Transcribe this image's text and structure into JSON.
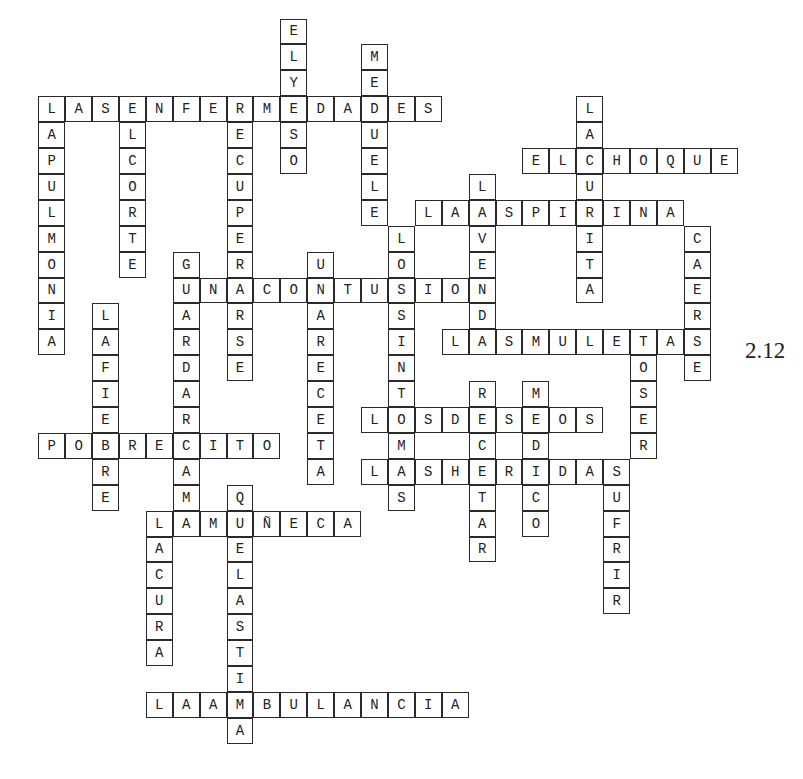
{
  "puzzle": {
    "label": "2.12",
    "grid": {
      "origin_x": 39,
      "origin_y": 97,
      "cell_w": 26.9,
      "cell_h": 25.9
    },
    "words": [
      {
        "answer": "LASENFERMEDADES",
        "dir": "across",
        "row": 0,
        "col": 0
      },
      {
        "answer": "ELYESO",
        "dir": "down",
        "row": -3,
        "col": 9
      },
      {
        "answer": "MEDUELE",
        "dir": "down",
        "row": -2,
        "col": 12
      },
      {
        "answer": "LAPULMONIA",
        "dir": "down",
        "row": 0,
        "col": 0
      },
      {
        "answer": "ELCORTE",
        "dir": "down",
        "row": 0,
        "col": 3
      },
      {
        "answer": "RECUPERARSE",
        "dir": "down",
        "row": 0,
        "col": 7
      },
      {
        "answer": "ELCHOQUE",
        "dir": "across",
        "row": 2,
        "col": 18
      },
      {
        "answer": "LACURITA",
        "dir": "down",
        "row": 0,
        "col": 20
      },
      {
        "answer": "LAASPIRINA",
        "dir": "across",
        "row": 4,
        "col": 14
      },
      {
        "answer": "LAVENDA",
        "dir": "down",
        "row": 3,
        "col": 16
      },
      {
        "answer": "CAERSE",
        "dir": "down",
        "row": 5,
        "col": 24
      },
      {
        "answer": "LOSSINTOMAS",
        "dir": "down",
        "row": 5,
        "col": 13
      },
      {
        "answer": "UNACONTUSION",
        "dir": "across",
        "row": 7,
        "col": 5
      },
      {
        "answer": "GUARDARCAMA",
        "dir": "down",
        "row": 6,
        "col": 5
      },
      {
        "answer": "UNARECETA",
        "dir": "down",
        "row": 6,
        "col": 10
      },
      {
        "answer": "LAFIEBRE",
        "dir": "down",
        "row": 8,
        "col": 2
      },
      {
        "answer": "LASMULETAS",
        "dir": "across",
        "row": 9,
        "col": 15
      },
      {
        "answer": "TOSER",
        "dir": "down",
        "row": 9,
        "col": 22
      },
      {
        "answer": "RECETAR",
        "dir": "down",
        "row": 11,
        "col": 16
      },
      {
        "answer": "MEDICO",
        "dir": "down",
        "row": 11,
        "col": 18
      },
      {
        "answer": "LOSDESEOS",
        "dir": "across",
        "row": 12,
        "col": 12
      },
      {
        "answer": "POBRECITO",
        "dir": "across",
        "row": 13,
        "col": 0
      },
      {
        "answer": "LASHERIDAS",
        "dir": "across",
        "row": 14,
        "col": 12
      },
      {
        "answer": "SUFRIR",
        "dir": "down",
        "row": 14,
        "col": 21
      },
      {
        "answer": "QUELASTIMA",
        "dir": "down",
        "row": 15,
        "col": 7
      },
      {
        "answer": "LAMUÑECA",
        "dir": "across",
        "row": 16,
        "col": 4
      },
      {
        "answer": "LACURA",
        "dir": "down",
        "row": 16,
        "col": 4
      },
      {
        "answer": "LAAMBULANCIA",
        "dir": "across",
        "row": 23,
        "col": 4
      }
    ]
  }
}
